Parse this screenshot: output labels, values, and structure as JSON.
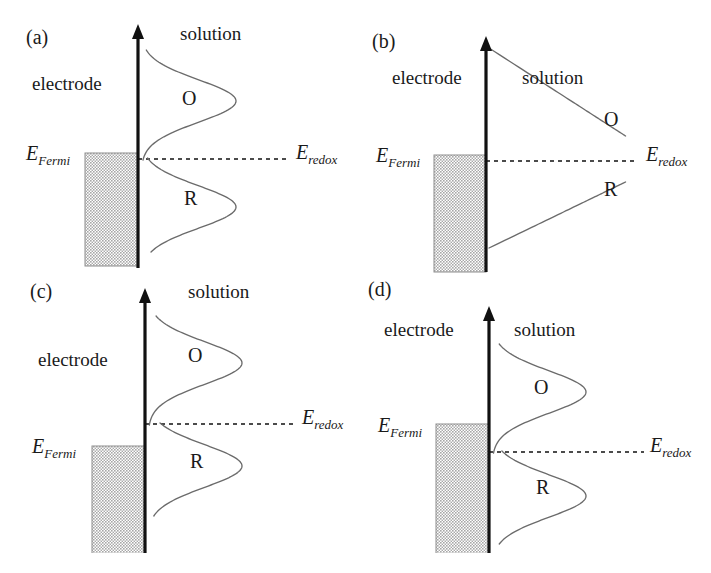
{
  "figure": {
    "background_color": "#ffffff",
    "curve_color": "#6b6b6b",
    "axis_color": "#111111",
    "band_fill_color": "#a8a8a8"
  },
  "labels": {
    "electrode": "electrode",
    "solution": "solution",
    "oxidized": "O",
    "reduced": "R",
    "fermi_symbol": "E",
    "fermi_subscript": "Fermi",
    "redox_symbol": "E",
    "redox_subscript": "redox"
  },
  "panels": [
    {
      "id": "a",
      "letter": "(a)",
      "electrode_label": "electrode",
      "solution_label": "solution",
      "o_label": "O",
      "r_label": "R",
      "fermi_label_symbol": "E",
      "fermi_label_sub": "Fermi",
      "redox_label_symbol": "E",
      "redox_label_sub": "redox",
      "description": "Equilibrium: Fermi level aligned with redox level; symmetric O and R Gaussian distributions",
      "fermi_relative_to_redox": "equal",
      "fermi_offset_px": 0,
      "distribution_type": "gaussian",
      "o_peak_offset_px": -62,
      "r_peak_offset_px": 60
    },
    {
      "id": "b",
      "letter": "(b)",
      "electrode_label": "electrode",
      "solution_label": "solution",
      "o_label": "O",
      "r_label": "R",
      "fermi_label_symbol": "E",
      "fermi_label_sub": "Fermi",
      "redox_label_symbol": "E",
      "redox_label_sub": "redox",
      "description": "Equilibrium with crossing monotonic O and R curves intersecting at the redox level",
      "fermi_relative_to_redox": "equal",
      "fermi_offset_px": 0,
      "distribution_type": "crossing",
      "o_peak_offset_px": 0,
      "r_peak_offset_px": 0
    },
    {
      "id": "c",
      "letter": "(c)",
      "electrode_label": "electrode",
      "solution_label": "solution",
      "o_label": "O",
      "r_label": "R",
      "fermi_label_symbol": "E",
      "fermi_label_sub": "Fermi",
      "redox_label_symbol": "E",
      "redox_label_sub": "redox",
      "description": "Anodic bias: Fermi level below the redox level; electrode band edge lowered",
      "fermi_relative_to_redox": "below",
      "fermi_offset_px": 28,
      "distribution_type": "gaussian",
      "o_peak_offset_px": -62,
      "r_peak_offset_px": 60
    },
    {
      "id": "d",
      "letter": "(d)",
      "electrode_label": "electrode",
      "solution_label": "solution",
      "o_label": "O",
      "r_label": "R",
      "fermi_label_symbol": "E",
      "fermi_label_sub": "Fermi",
      "redox_label_symbol": "E",
      "redox_label_sub": "redox",
      "description": "Cathodic bias: Fermi level above the redox level; electrode band edge raised",
      "fermi_relative_to_redox": "above",
      "fermi_offset_px": -22,
      "distribution_type": "gaussian",
      "o_peak_offset_px": -62,
      "r_peak_offset_px": 60
    }
  ]
}
